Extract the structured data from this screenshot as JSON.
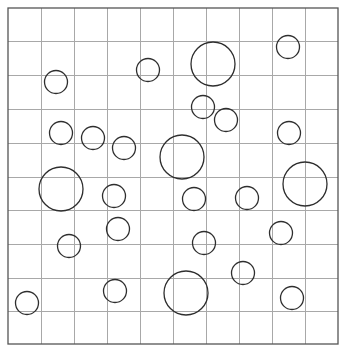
{
  "figure": {
    "width": 345,
    "height": 350,
    "background": "#ffffff",
    "grid": {
      "left": 8,
      "top": 8,
      "right": 338,
      "bottom": 344,
      "columns": 10,
      "rows": 10,
      "x_lines": [
        8,
        41,
        74,
        107,
        140,
        173,
        206,
        239,
        272,
        305,
        338
      ],
      "y_lines": [
        8,
        41,
        75,
        109,
        143,
        177,
        210,
        244,
        278,
        311,
        344
      ],
      "line_color": "#a8a8a8",
      "border_color": "#555555"
    },
    "circle_color": "#2e2e2e",
    "circles": [
      {
        "cx": 213,
        "cy": 64,
        "r": 22,
        "size": "large"
      },
      {
        "cx": 288,
        "cy": 47,
        "r": 11.5,
        "size": "small"
      },
      {
        "cx": 56,
        "cy": 82,
        "r": 11.5,
        "size": "small"
      },
      {
        "cx": 148,
        "cy": 70,
        "r": 11.5,
        "size": "small"
      },
      {
        "cx": 203,
        "cy": 107,
        "r": 11.5,
        "size": "small"
      },
      {
        "cx": 226,
        "cy": 120,
        "r": 11.5,
        "size": "small"
      },
      {
        "cx": 61,
        "cy": 133,
        "r": 11.5,
        "size": "small"
      },
      {
        "cx": 93,
        "cy": 138,
        "r": 11.5,
        "size": "small"
      },
      {
        "cx": 124,
        "cy": 148,
        "r": 11.5,
        "size": "small"
      },
      {
        "cx": 182,
        "cy": 157,
        "r": 22,
        "size": "large"
      },
      {
        "cx": 289,
        "cy": 133,
        "r": 11.5,
        "size": "small"
      },
      {
        "cx": 61,
        "cy": 189,
        "r": 22,
        "size": "large"
      },
      {
        "cx": 305,
        "cy": 184,
        "r": 22,
        "size": "large"
      },
      {
        "cx": 114,
        "cy": 196,
        "r": 11.5,
        "size": "small"
      },
      {
        "cx": 194,
        "cy": 199,
        "r": 11.5,
        "size": "small"
      },
      {
        "cx": 247,
        "cy": 198,
        "r": 11.5,
        "size": "small"
      },
      {
        "cx": 118,
        "cy": 229,
        "r": 11.5,
        "size": "small"
      },
      {
        "cx": 281,
        "cy": 233,
        "r": 11.5,
        "size": "small"
      },
      {
        "cx": 69,
        "cy": 246,
        "r": 11.5,
        "size": "small"
      },
      {
        "cx": 204,
        "cy": 243,
        "r": 11.5,
        "size": "small"
      },
      {
        "cx": 243,
        "cy": 273,
        "r": 11.5,
        "size": "small"
      },
      {
        "cx": 27,
        "cy": 303,
        "r": 11.5,
        "size": "small"
      },
      {
        "cx": 115,
        "cy": 291,
        "r": 11.5,
        "size": "small"
      },
      {
        "cx": 186,
        "cy": 293,
        "r": 22,
        "size": "large"
      },
      {
        "cx": 292,
        "cy": 298,
        "r": 11.5,
        "size": "small"
      }
    ]
  }
}
